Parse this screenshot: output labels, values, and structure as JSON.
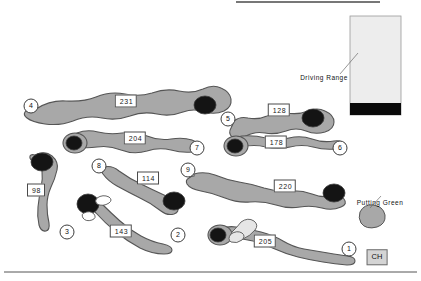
{
  "map": {
    "title": "Golf Course Layout Map",
    "width": 421,
    "height": 281,
    "colors": {
      "background": "#ffffff",
      "fairway_fill": "#a8a8a8",
      "fairway_stroke": "#555555",
      "green_fill": "#141414",
      "green_stroke": "#555555",
      "bunker_light": "#e6e6e6",
      "bunker_white": "#ffffff",
      "driving_range_fill": "#ededed",
      "driving_range_band": "#0a0a0a",
      "clubhouse_fill": "#d4d4d4",
      "label_border": "#4a4a4a",
      "rule_line": "#555555"
    }
  },
  "holes": [
    {
      "number": "1",
      "yardage": "205",
      "marker_x": 349,
      "marker_y": 249,
      "label_x": 265,
      "label_y": 241
    },
    {
      "number": "2",
      "yardage": "143",
      "marker_x": 178,
      "marker_y": 235,
      "label_x": 121,
      "label_y": 231
    },
    {
      "number": "3",
      "yardage": "98",
      "marker_x": 67,
      "marker_y": 232,
      "label_x": 36,
      "label_y": 190
    },
    {
      "number": "4",
      "yardage": "231",
      "marker_x": 31,
      "marker_y": 106,
      "label_x": 126,
      "label_y": 101
    },
    {
      "number": "5",
      "yardage": "128",
      "marker_x": 228,
      "marker_y": 119,
      "label_x": 279,
      "label_y": 110
    },
    {
      "number": "6",
      "yardage": "178",
      "marker_x": 340,
      "marker_y": 148,
      "label_x": 276,
      "label_y": 142
    },
    {
      "number": "7",
      "yardage": "204",
      "marker_x": 197,
      "marker_y": 148,
      "label_x": 135,
      "label_y": 138
    },
    {
      "number": "8",
      "yardage": "114",
      "marker_x": 99,
      "marker_y": 166,
      "label_x": 148,
      "label_y": 178
    },
    {
      "number": "9",
      "yardage": "220",
      "marker_x": 188,
      "marker_y": 170,
      "label_x": 285,
      "label_y": 186
    }
  ],
  "annotations": [
    {
      "id": "driving-range",
      "text": "Driving Range",
      "x": 324,
      "y": 77
    },
    {
      "id": "putting-green",
      "text": "Putting Green",
      "x": 380,
      "y": 202
    }
  ],
  "clubhouse": {
    "label": "CH",
    "x": 377,
    "y": 257
  },
  "features": {
    "driving_range": {
      "name": "Driving Range"
    },
    "putting_green": {
      "name": "Putting Green"
    },
    "clubhouse": {
      "name": "Clubhouse"
    }
  }
}
